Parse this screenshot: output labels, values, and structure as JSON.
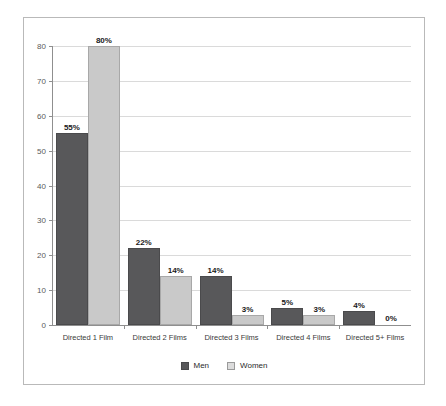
{
  "chart_data": {
    "type": "bar",
    "title": "",
    "subtitle": "",
    "xlabel": "",
    "ylabel": "",
    "ylim": [
      0,
      80
    ],
    "ytick_step": 10,
    "yticks": [
      "0",
      "10",
      "20",
      "30",
      "40",
      "50",
      "60",
      "70",
      "80"
    ],
    "grid": true,
    "legend_position": "bottom-center",
    "categories": [
      "Directed 1 Film",
      "Directed 2 Films",
      "Directed 3 Films",
      "Directed 4 Films",
      "Directed 5+ Films"
    ],
    "series": [
      {
        "name": "Men",
        "color": "#58585a",
        "values": [
          55,
          22,
          14,
          5,
          4
        ],
        "labels": [
          "55%",
          "22%",
          "14%",
          "5%",
          "4%"
        ]
      },
      {
        "name": "Women",
        "color": "#c9c9c9",
        "values": [
          80,
          14,
          3,
          3,
          0
        ],
        "labels": [
          "80%",
          "14%",
          "3%",
          "3%",
          "0%"
        ]
      }
    ]
  },
  "legend": {
    "items": [
      {
        "label": "Men",
        "swatch": "men"
      },
      {
        "label": "Women",
        "swatch": "women"
      }
    ]
  },
  "colors": {
    "men_bar": "#58585a",
    "women_bar": "#c9c9c9",
    "gridline": "#dadada",
    "axis": "#8f8f8f",
    "frame_border": "#b9b9b9",
    "background": "#ffffff"
  }
}
